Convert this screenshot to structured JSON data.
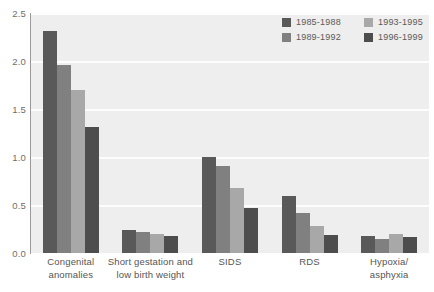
{
  "chart_data": {
    "type": "bar",
    "title": "",
    "subtitle": "",
    "xlabel": "",
    "ylabel": "",
    "ylim": [
      0.0,
      2.5
    ],
    "yticks": [
      "0.0",
      "0.5",
      "1.0",
      "1.5",
      "2.0",
      "2.5"
    ],
    "ytick_values": [
      0.0,
      0.5,
      1.0,
      1.5,
      2.0,
      2.5
    ],
    "grid": true,
    "grid_axis": "y",
    "legend_position": "top-right",
    "categories": [
      "Congenital anomalies",
      "Short gestation and low birth weight",
      "SIDS",
      "RDS",
      "Hypoxia/ asphyxia"
    ],
    "category_lines": [
      [
        "Congenital",
        "anomalies"
      ],
      [
        "Short gestation and",
        "low birth weight"
      ],
      [
        "SIDS"
      ],
      [
        "RDS"
      ],
      [
        "Hypoxia/",
        "asphyxia"
      ]
    ],
    "series": [
      {
        "name": "1985-1988",
        "color": "#595959",
        "values": [
          2.31,
          0.24,
          1.0,
          0.59,
          0.18
        ]
      },
      {
        "name": "1989-1992",
        "color": "#808080",
        "values": [
          1.96,
          0.22,
          0.91,
          0.42,
          0.15
        ]
      },
      {
        "name": "1993-1995",
        "color": "#a8a8a8",
        "values": [
          1.7,
          0.2,
          0.68,
          0.28,
          0.2
        ]
      },
      {
        "name": "1996-1999",
        "color": "#4d4d4d",
        "values": [
          1.31,
          0.18,
          0.47,
          0.19,
          0.17
        ]
      }
    ]
  },
  "style": {
    "plot_background": "#eeeeee",
    "gridline_color": "#fdfdfd",
    "axis_color": "#9a9a9a",
    "tick_label_color": "#6e6e6e",
    "category_label_color": "#555555",
    "legend_label_color": "#5a5a5a"
  }
}
